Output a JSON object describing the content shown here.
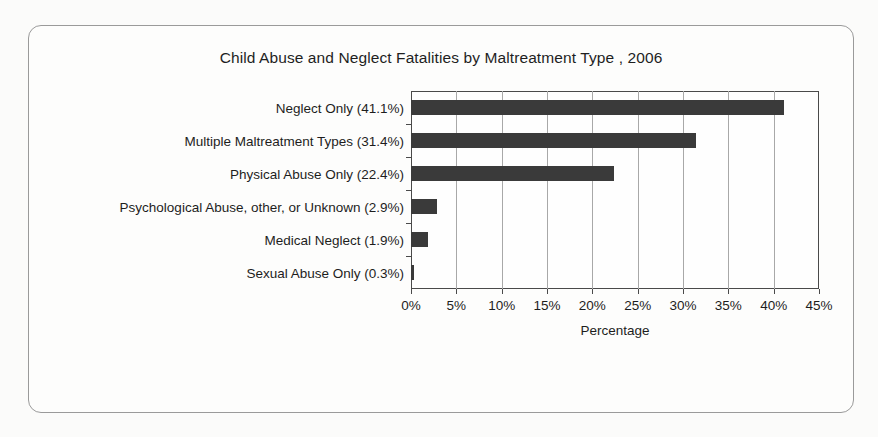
{
  "figure": {
    "title": "Child Abuse and Neglect Fatalities by Maltreatment Type , 2006",
    "frame_color": "#9a9a9a",
    "background_color": "#fbfbfa"
  },
  "chart_data": {
    "type": "bar",
    "orientation": "horizontal",
    "title": "Child Abuse and Neglect Fatalities by Maltreatment Type , 2006",
    "xlabel": "Percentage",
    "ylabel": "",
    "categories": [
      "Neglect Only (41.1%)",
      "Multiple Maltreatment Types (31.4%)",
      "Physical Abuse Only (22.4%)",
      "Psychological Abuse, other, or Unknown (2.9%)",
      "Medical Neglect (1.9%)",
      "Sexual Abuse Only (0.3%)"
    ],
    "category_names": [
      "Neglect Only",
      "Multiple Maltreatment Types",
      "Physical Abuse Only",
      "Psychological Abuse, other, or Unknown",
      "Medical Neglect",
      "Sexual Abuse Only"
    ],
    "values": [
      41.1,
      31.4,
      22.4,
      2.9,
      1.9,
      0.3
    ],
    "value_labels": [
      "41.1%",
      "31.4%",
      "22.4%",
      "2.9%",
      "1.9%",
      "0.3%"
    ],
    "xlim": [
      0,
      45
    ],
    "xticks": [
      0,
      5,
      10,
      15,
      20,
      25,
      30,
      35,
      40,
      45
    ],
    "xtick_labels": [
      "0%",
      "5%",
      "10%",
      "15%",
      "20%",
      "25%",
      "30%",
      "35%",
      "40%",
      "45%"
    ],
    "grid": "vertical",
    "legend": "none",
    "bar_color": "#3a3a3a",
    "axis_color": "#4a4a4a",
    "gridline_color": "#a8a8a8"
  }
}
